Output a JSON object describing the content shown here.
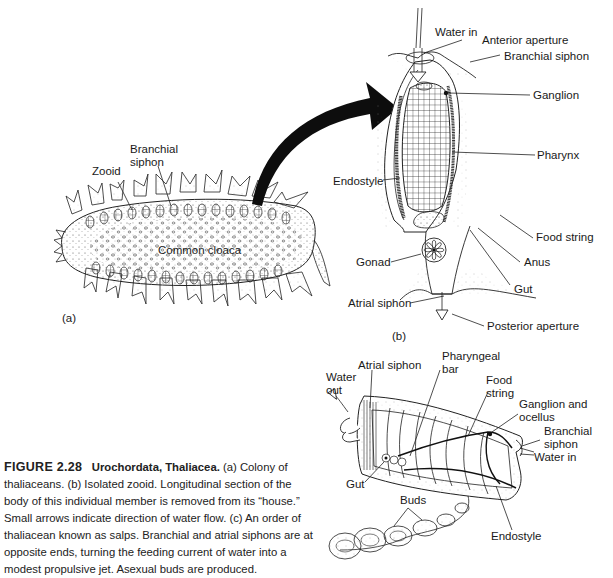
{
  "figure": {
    "number": "FIGURE 2.28",
    "title": "Urochordata, Thaliacea.",
    "caption": "(a) Colony of thaliaceans. (b) Isolated zooid. Longitudinal section of the body of this individual member is removed from its “house.” Small arrows indicate direction of water flow. (c) An order of thaliacean known as salps. Branchial and atrial siphons are at opposite ends, turning the feeding current of water into a modest propulsive jet. Asexual buds are produced."
  },
  "panel_a": {
    "tag": "(a)",
    "labels": {
      "zooid": "Zooid",
      "branchial_siphon_1": "Branchial",
      "branchial_siphon_2": "siphon",
      "common_cloaca": "Common cloaca"
    }
  },
  "panel_b": {
    "tag": "(b)",
    "labels": {
      "water_in": "Water in",
      "anterior_aperture": "Anterior aperture",
      "branchial_siphon": "Branchial siphon",
      "ganglion": "Ganglion",
      "pharynx": "Pharynx",
      "endostyle": "Endostyle",
      "food_string": "Food string",
      "gonad": "Gonad",
      "anus": "Anus",
      "gut": "Gut",
      "atrial_siphon": "Atrial siphon",
      "posterior_aperture": "Posterior aperture"
    }
  },
  "panel_c": {
    "labels": {
      "atrial_siphon": "Atrial siphon",
      "pharyngeal_bar_1": "Pharyngeal",
      "pharyngeal_bar_2": "bar",
      "water_out_1": "Water",
      "water_out_2": "out",
      "food_string_1": "Food",
      "food_string_2": "string",
      "ganglion_ocellus_1": "Ganglion and",
      "ganglion_ocellus_2": "ocellus",
      "branchial_siphon_1": "Branchial",
      "branchial_siphon_2": "siphon",
      "water_in": "Water in",
      "gut": "Gut",
      "buds": "Buds",
      "endostyle": "Endostyle"
    }
  }
}
